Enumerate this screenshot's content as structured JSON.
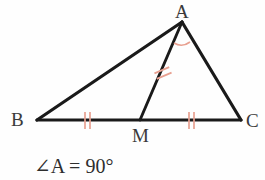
{
  "figure": {
    "kind": "geometry-diagram",
    "background_color": "#fefefe",
    "stroke_color": "#1a1a1a",
    "tick_color": "#e8a090",
    "label_color": "#3a3a3a"
  },
  "labels": {
    "A": "A",
    "B": "B",
    "C": "C",
    "M": "M"
  },
  "caption": {
    "text": "∠A = 90°"
  },
  "points": {
    "A": {
      "x": 182,
      "y": 22
    },
    "B": {
      "x": 37,
      "y": 120
    },
    "C": {
      "x": 241,
      "y": 120
    },
    "M": {
      "x": 140,
      "y": 120
    }
  },
  "segments": [
    {
      "name": "AB",
      "from": "A",
      "to": "B",
      "ticks": 0
    },
    {
      "name": "BC",
      "from": "B",
      "to": "C",
      "ticks": 0
    },
    {
      "name": "CA",
      "from": "C",
      "to": "A",
      "ticks": 0
    },
    {
      "name": "AM",
      "from": "A",
      "to": "M",
      "ticks": 2
    },
    {
      "name": "BM",
      "from": "B",
      "to": "M",
      "ticks": 2
    },
    {
      "name": "MC",
      "from": "M",
      "to": "C",
      "ticks": 2
    }
  ],
  "angle_marks": [
    {
      "name": "angle-at-A",
      "vertex": "A",
      "between": "AM and AC"
    }
  ]
}
